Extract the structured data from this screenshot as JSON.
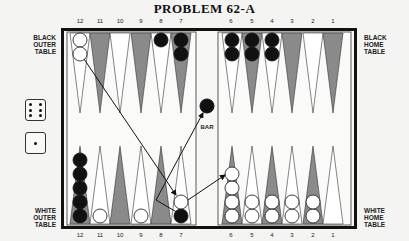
{
  "title": "PROBLEM 62-A",
  "labels": {
    "black_outer": [
      "BLACK",
      "OUTER",
      "TABLE"
    ],
    "black_home": [
      "BLACK",
      "HOME",
      "TABLE"
    ],
    "white_outer": [
      "WHITE",
      "OUTER",
      "TABLE"
    ],
    "white_home": [
      "WHITE",
      "HOME",
      "TABLE"
    ],
    "bar": "BAR"
  },
  "top_numbers": [
    "12",
    "11",
    "10",
    "9",
    "8",
    "7",
    "6",
    "5",
    "4",
    "3",
    "2",
    "1"
  ],
  "bottom_numbers": [
    "12",
    "11",
    "10",
    "9",
    "8",
    "7",
    "6",
    "5",
    "4",
    "3",
    "2",
    "1"
  ],
  "dice": [
    6,
    1
  ],
  "colors": {
    "frame": "#111111",
    "board": "#f7f7f5",
    "dark_point": "#8a8a8a",
    "light_point": "#ffffff",
    "black_checker": "#111111",
    "white_checker": "#ffffff"
  },
  "position": {
    "top": [
      {
        "point": 12,
        "color": "white",
        "count": 2
      },
      {
        "point": 8,
        "color": "black",
        "count": 1
      },
      {
        "point": 7,
        "color": "black",
        "count": 2
      },
      {
        "point": 6,
        "color": "black",
        "count": 2
      },
      {
        "point": 5,
        "color": "black",
        "count": 2
      },
      {
        "point": 4,
        "color": "black",
        "count": 2
      }
    ],
    "bottom": [
      {
        "point": 12,
        "color": "black",
        "count": 5
      },
      {
        "point": 11,
        "color": "white",
        "count": 1
      },
      {
        "point": 9,
        "color": "white",
        "count": 1
      },
      {
        "point": 7,
        "color": "black",
        "count": 1
      },
      {
        "point": 7,
        "color": "white",
        "count": 1
      },
      {
        "point": 6,
        "color": "white",
        "count": 4
      },
      {
        "point": 5,
        "color": "white",
        "count": 2
      },
      {
        "point": 4,
        "color": "white",
        "count": 2
      },
      {
        "point": 3,
        "color": "white",
        "count": 2
      },
      {
        "point": 2,
        "color": "white",
        "count": 2
      }
    ],
    "bar": [
      {
        "color": "black",
        "count": 1
      }
    ]
  },
  "arrows": [
    {
      "from": "black-outer-12 white checker",
      "to": "white-outer-7"
    },
    {
      "from": "white-outer-7 black checker (hit)",
      "to": "bar"
    },
    {
      "from": "white-outer-7",
      "to": "white-home-6"
    }
  ]
}
